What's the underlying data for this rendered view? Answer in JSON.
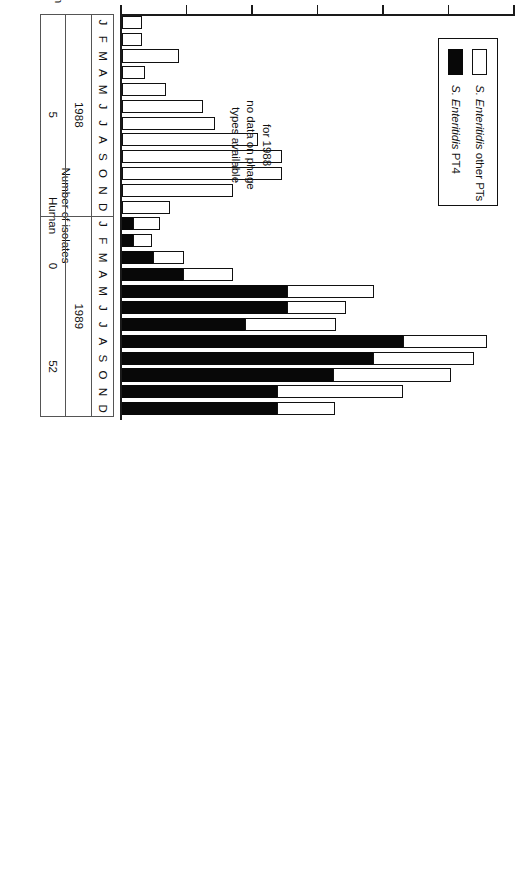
{
  "chart_data": {
    "type": "bar",
    "orientation": "horizontal-rotated",
    "title": "",
    "xlabel": "",
    "ylabel": "Number of isolates",
    "ylabel_group": "Human",
    "ylim": [
      0,
      600
    ],
    "yticks": [
      0,
      100,
      200,
      300,
      400,
      500,
      600
    ],
    "grid": false,
    "legend_position": "inside-left",
    "categories": [
      "J",
      "F",
      "M",
      "A",
      "M",
      "J",
      "J",
      "A",
      "S",
      "O",
      "N",
      "D",
      "J",
      "F",
      "M",
      "A",
      "M",
      "J",
      "J",
      "A",
      "S",
      "O",
      "N",
      "D"
    ],
    "group_labels": [
      "1988",
      "1989"
    ],
    "series": [
      {
        "name": "S. Enteritidis PT4",
        "color": "#080808",
        "values": [
          0,
          0,
          0,
          0,
          0,
          0,
          0,
          0,
          0,
          0,
          0,
          0,
          17,
          17,
          47,
          93,
          252,
          252,
          188,
          429,
          383,
          322,
          237,
          237
        ]
      },
      {
        "name": "S. Enteritidis other PTs",
        "color": "#ffffff",
        "values": [
          31,
          31,
          87,
          35,
          67,
          124,
          142,
          207,
          245,
          245,
          169,
          73,
          41,
          29,
          48,
          77,
          133,
          90,
          139,
          128,
          155,
          180,
          192,
          88
        ]
      }
    ],
    "totals": [
      31,
      31,
      87,
      35,
      67,
      124,
      142,
      207,
      245,
      245,
      169,
      73,
      58,
      46,
      95,
      170,
      385,
      342,
      327,
      557,
      538,
      502,
      429,
      325
    ],
    "annotation": [
      "for 1988",
      "no data on phage",
      "types available"
    ]
  },
  "axis": {
    "tick_labels": [
      "600",
      "500",
      "400",
      "300",
      "200",
      "100",
      "0"
    ],
    "title_line1": "Number of isolates",
    "title_line2": "Human"
  },
  "legend": {
    "items": [
      {
        "label": "S. Enteritidis other PTs",
        "swatch": "white"
      },
      {
        "label": "S. Enteritidis PT4",
        "swatch": "black"
      }
    ]
  },
  "note": {
    "line1": "for 1988",
    "line2": "no data on phage",
    "line3": "types available"
  },
  "months": {
    "y1988": [
      "J",
      "F",
      "M",
      "A",
      "M",
      "J",
      "J",
      "A",
      "S",
      "O",
      "N",
      "D"
    ],
    "y1989": [
      "J",
      "F",
      "M",
      "A",
      "M",
      "J",
      "J",
      "A",
      "S",
      "O",
      "N",
      "D"
    ]
  },
  "years": {
    "y1988": "1988",
    "y1989": "1989"
  },
  "nonhuman": {
    "row_label_line1": "Nonhuman",
    "row_label_line2": "PT 4",
    "v1988": "5",
    "v1989_first_half": "0",
    "v1989_second_half": "52"
  }
}
